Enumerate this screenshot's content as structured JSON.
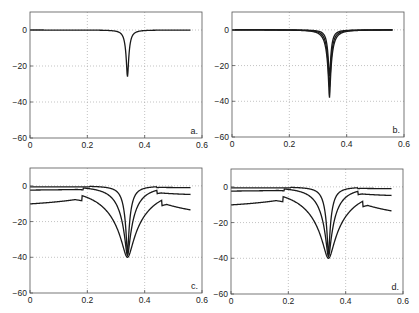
{
  "chart_data": [
    {
      "panel": "a.",
      "type": "line",
      "xlim": [
        0,
        0.6
      ],
      "ylim": [
        -60,
        10
      ],
      "xticks": [
        0,
        0.2,
        0.4,
        0.6
      ],
      "xtick_labels": [
        "0",
        "0.2",
        "0.4",
        "0.6"
      ],
      "yticks": [
        0,
        -20,
        -40,
        -60
      ],
      "ytick_labels": [
        "0",
        "−20",
        "−40",
        "−60"
      ],
      "grid": true,
      "x_range": [
        0,
        0.56
      ],
      "series": [
        {
          "name": "curve 1",
          "center": 0.34,
          "min_db": -26,
          "width": 0.012,
          "offset_left": 0,
          "offset_right": 0
        }
      ]
    },
    {
      "panel": "b.",
      "type": "line",
      "xlim": [
        0,
        0.6
      ],
      "ylim": [
        -60,
        10
      ],
      "xticks": [
        0,
        0.2,
        0.4,
        0.6
      ],
      "xtick_labels": [
        "0",
        "0.2",
        "0.4",
        "0.6"
      ],
      "yticks": [
        0,
        -20,
        -40,
        -60
      ],
      "ytick_labels": [
        "0",
        "−20",
        "−40",
        "−60"
      ],
      "grid": true,
      "x_range": [
        0,
        0.56
      ],
      "series": [
        {
          "name": "curve 1",
          "center": 0.34,
          "min_db": -26,
          "width": 0.012,
          "offset_left": 0,
          "offset_right": 0
        },
        {
          "name": "curve 2",
          "center": 0.34,
          "min_db": -32,
          "width": 0.016,
          "offset_left": 0,
          "offset_right": 0
        },
        {
          "name": "curve 3",
          "center": 0.34,
          "min_db": -38,
          "width": 0.02,
          "offset_left": 0,
          "offset_right": 0
        }
      ]
    },
    {
      "panel": "c.",
      "type": "line",
      "xlim": [
        0,
        0.6
      ],
      "ylim": [
        -60,
        10
      ],
      "xticks": [
        0,
        0.2,
        0.4,
        0.6
      ],
      "xtick_labels": [
        "0",
        "0.2",
        "0.4",
        "0.6"
      ],
      "yticks": [
        0,
        -20,
        -40,
        -60
      ],
      "ytick_labels": [
        "0",
        "−20",
        "−40",
        "−60"
      ],
      "grid": true,
      "x_range": [
        0,
        0.56
      ],
      "series": [
        {
          "name": "curve 1",
          "center": 0.34,
          "min_db": -38,
          "width": 0.025,
          "start_db": -0.3,
          "end_db": -0.5
        },
        {
          "name": "curve 2",
          "center": 0.34,
          "min_db": -39,
          "width": 0.06,
          "start_db": -1.2,
          "end_db": -2.5
        },
        {
          "name": "curve 3",
          "center": 0.34,
          "min_db": -40,
          "width": 0.15,
          "start_db": -5.5,
          "end_db": -8
        }
      ]
    },
    {
      "panel": "d.",
      "type": "line",
      "xlim": [
        0,
        0.6
      ],
      "ylim": [
        -60,
        10
      ],
      "xticks": [
        0,
        0.2,
        0.4,
        0.6
      ],
      "xtick_labels": [
        "0",
        "0.2",
        "0.4",
        "0.6"
      ],
      "yticks": [
        0,
        -20,
        -40,
        -60
      ],
      "ytick_labels": [
        "0",
        "−20",
        "−40",
        "−60"
      ],
      "grid": true,
      "x_range": [
        0,
        0.56
      ],
      "series": [
        {
          "name": "curve 1",
          "center": 0.34,
          "min_db": -38,
          "width": 0.025,
          "start_db": -0.3,
          "end_db": -0.5
        },
        {
          "name": "curve 2",
          "center": 0.34,
          "min_db": -39,
          "width": 0.06,
          "start_db": -1.2,
          "end_db": -2.5
        },
        {
          "name": "curve 3",
          "center": 0.34,
          "min_db": -40,
          "width": 0.15,
          "start_db": -5.5,
          "end_db": -8
        }
      ]
    }
  ],
  "panels": [
    {
      "label": "a.",
      "box": [
        30,
        12,
        202,
        138
      ]
    },
    {
      "label": "b.",
      "box": [
        232,
        12,
        404,
        137
      ]
    },
    {
      "label": "c.",
      "box": [
        30,
        168,
        202,
        293
      ]
    },
    {
      "label": "d.",
      "box": [
        231,
        169,
        403,
        294
      ]
    }
  ],
  "colors": {
    "line": "#1a1a1a",
    "axis": "#555555",
    "grid": "#9a9a9a"
  }
}
